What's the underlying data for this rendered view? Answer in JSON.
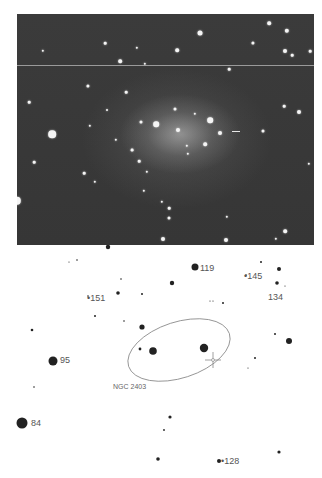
{
  "photo": {
    "subject": "galaxy-photograph",
    "background_color": "#3a3a3a",
    "stars": [
      {
        "x": 183,
        "y": 19,
        "r": 2.5
      },
      {
        "x": 160,
        "y": 36,
        "r": 1.8
      },
      {
        "x": 88,
        "y": 29,
        "r": 1.3
      },
      {
        "x": 120,
        "y": 34,
        "r": 1.2
      },
      {
        "x": 26,
        "y": 37,
        "r": 1.2
      },
      {
        "x": 103,
        "y": 47,
        "r": 1.8
      },
      {
        "x": 128,
        "y": 50,
        "r": 1.2
      },
      {
        "x": 252,
        "y": 9,
        "r": 1.8
      },
      {
        "x": 270,
        "y": 17,
        "r": 2.2
      },
      {
        "x": 236,
        "y": 29,
        "r": 1.6
      },
      {
        "x": 268,
        "y": 37,
        "r": 2.0
      },
      {
        "x": 275,
        "y": 41,
        "r": 1.3
      },
      {
        "x": 293,
        "y": 37,
        "r": 1.3
      },
      {
        "x": 212,
        "y": 55,
        "r": 1.3
      },
      {
        "x": 71,
        "y": 72,
        "r": 1.6
      },
      {
        "x": 109,
        "y": 78,
        "r": 1.3
      },
      {
        "x": 12,
        "y": 88,
        "r": 1.3
      },
      {
        "x": 90,
        "y": 96,
        "r": 1.0
      },
      {
        "x": 139,
        "y": 110,
        "r": 2.8
      },
      {
        "x": 193,
        "y": 106,
        "r": 2.8
      },
      {
        "x": 124,
        "y": 108,
        "r": 1.5
      },
      {
        "x": 203,
        "y": 119,
        "r": 2.0
      },
      {
        "x": 246,
        "y": 117,
        "r": 1.5
      },
      {
        "x": 282,
        "y": 98,
        "r": 2.0
      },
      {
        "x": 267,
        "y": 92,
        "r": 1.3
      },
      {
        "x": 35,
        "y": 120,
        "r": 3.8
      },
      {
        "x": 73,
        "y": 112,
        "r": 1.2
      },
      {
        "x": 99,
        "y": 126,
        "r": 1.2
      },
      {
        "x": 188,
        "y": 130,
        "r": 1.8
      },
      {
        "x": 115,
        "y": 136,
        "r": 1.4
      },
      {
        "x": 17,
        "y": 148,
        "r": 1.3
      },
      {
        "x": 122,
        "y": 147,
        "r": 1.3
      },
      {
        "x": 67,
        "y": 159,
        "r": 1.3
      },
      {
        "x": 130,
        "y": 158,
        "r": 1.2
      },
      {
        "x": 78,
        "y": 168,
        "r": 1.2
      },
      {
        "x": 127,
        "y": 177,
        "r": 1.2
      },
      {
        "x": 145,
        "y": 188,
        "r": 1.2
      },
      {
        "x": 152,
        "y": 194,
        "r": 1.3
      },
      {
        "x": 0,
        "y": 187,
        "r": 4.2
      },
      {
        "x": 152,
        "y": 204,
        "r": 1.5
      },
      {
        "x": 268,
        "y": 217,
        "r": 1.8
      },
      {
        "x": 146,
        "y": 225,
        "r": 2.0
      },
      {
        "x": 209,
        "y": 226,
        "r": 2.0
      },
      {
        "x": 259,
        "y": 225,
        "r": 1.2
      },
      {
        "x": 210,
        "y": 203,
        "r": 1.2
      },
      {
        "x": 292,
        "y": 150,
        "r": 1.2
      },
      {
        "x": 171,
        "y": 140,
        "r": 1.2
      },
      {
        "x": 158,
        "y": 95,
        "r": 1.5
      },
      {
        "x": 161,
        "y": 116,
        "r": 2.0
      },
      {
        "x": 170,
        "y": 132,
        "r": 1.2
      },
      {
        "x": 178,
        "y": 100,
        "r": 1.2
      }
    ],
    "streak": {
      "x": 215,
      "y": 117
    }
  },
  "chart": {
    "ellipse": {
      "cx": 179,
      "cy": 105,
      "rx": 53,
      "ry": 28,
      "rotate": -18,
      "stroke": "#888888"
    },
    "crosshair": {
      "x": 213,
      "y": 115
    },
    "stars": [
      {
        "x": 108,
        "y": 2,
        "r": 2.2
      },
      {
        "x": 77,
        "y": 15,
        "r": 0.8
      },
      {
        "x": 69,
        "y": 17,
        "r": 0.6
      },
      {
        "x": 195,
        "y": 22,
        "r": 3.5
      },
      {
        "x": 261,
        "y": 17,
        "r": 1.0
      },
      {
        "x": 279,
        "y": 24,
        "r": 2.0
      },
      {
        "x": 246,
        "y": 30,
        "r": 0.8
      },
      {
        "x": 277,
        "y": 38,
        "r": 1.8
      },
      {
        "x": 285,
        "y": 41,
        "r": 0.6
      },
      {
        "x": 172,
        "y": 38,
        "r": 2.2
      },
      {
        "x": 121,
        "y": 34,
        "r": 0.8
      },
      {
        "x": 118,
        "y": 48,
        "r": 1.8
      },
      {
        "x": 142,
        "y": 49,
        "r": 1.0
      },
      {
        "x": 88,
        "y": 51,
        "r": 0.8
      },
      {
        "x": 210,
        "y": 56,
        "r": 0.6
      },
      {
        "x": 213,
        "y": 56,
        "r": 0.6
      },
      {
        "x": 223,
        "y": 58,
        "r": 1.0
      },
      {
        "x": 95,
        "y": 71,
        "r": 1.0
      },
      {
        "x": 124,
        "y": 76,
        "r": 0.8
      },
      {
        "x": 142,
        "y": 82,
        "r": 2.6
      },
      {
        "x": 32,
        "y": 85,
        "r": 1.3
      },
      {
        "x": 275,
        "y": 89,
        "r": 1.0
      },
      {
        "x": 289,
        "y": 96,
        "r": 3.0
      },
      {
        "x": 140,
        "y": 104,
        "r": 1.4
      },
      {
        "x": 153,
        "y": 106,
        "r": 3.8
      },
      {
        "x": 204,
        "y": 103,
        "r": 4.2
      },
      {
        "x": 255,
        "y": 113,
        "r": 1.0
      },
      {
        "x": 248,
        "y": 123,
        "r": 0.6
      },
      {
        "x": 53,
        "y": 116,
        "r": 4.5
      },
      {
        "x": 34,
        "y": 142,
        "r": 0.8
      },
      {
        "x": 22,
        "y": 178,
        "r": 5.5
      },
      {
        "x": 170,
        "y": 172,
        "r": 1.6
      },
      {
        "x": 164,
        "y": 185,
        "r": 0.9
      },
      {
        "x": 158,
        "y": 214,
        "r": 1.8
      },
      {
        "x": 219,
        "y": 216,
        "r": 2.0
      },
      {
        "x": 279,
        "y": 207,
        "r": 1.6
      }
    ],
    "labels": [
      {
        "text": "119",
        "x": 200,
        "y": 18,
        "cls": ""
      },
      {
        "text": "•145",
        "x": 244,
        "y": 26,
        "cls": ""
      },
      {
        "text": "134",
        "x": 268,
        "y": 47,
        "cls": ""
      },
      {
        "text": "•151",
        "x": 87,
        "y": 48,
        "cls": ""
      },
      {
        "text": "95",
        "x": 60,
        "y": 110,
        "cls": ""
      },
      {
        "text": "NGC 2403",
        "x": 113,
        "y": 137,
        "cls": "small"
      },
      {
        "text": "84",
        "x": 31,
        "y": 173,
        "cls": ""
      },
      {
        "text": "•128",
        "x": 221,
        "y": 211,
        "cls": ""
      }
    ]
  }
}
